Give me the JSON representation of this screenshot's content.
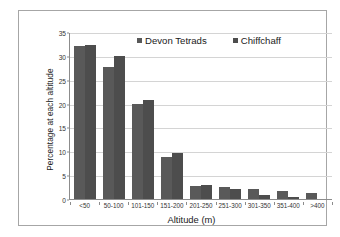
{
  "chart_data": {
    "type": "bar",
    "title": "",
    "xlabel": "Altitude (m)",
    "ylabel": "Percentage at each altitude",
    "categories": [
      "<50",
      "50-100",
      "101-150",
      "151-200",
      "201-250",
      "251-300",
      "301-350",
      "351-400",
      ">400"
    ],
    "series": [
      {
        "name": "Devon Tetrads",
        "color": "#595959",
        "values": [
          32.0,
          27.7,
          19.9,
          8.9,
          2.7,
          2.6,
          2.0,
          1.6,
          1.3
        ]
      },
      {
        "name": "Chiffchaff",
        "color": "#4d4d4d",
        "values": [
          32.3,
          29.9,
          20.8,
          9.7,
          2.9,
          2.1,
          0.9,
          0.4,
          0.0
        ]
      }
    ],
    "ylim": [
      0,
      35
    ],
    "yticks": [
      0,
      5,
      10,
      15,
      20,
      25,
      30,
      35
    ],
    "ytick_labels": [
      "0",
      "5",
      "10",
      "15",
      "20",
      "25",
      "30",
      "35"
    ],
    "grid": true,
    "legend_position": "top-center"
  },
  "legend": {
    "items": [
      {
        "label": "Devon Tetrads",
        "marker": "square-marker",
        "color": "#595959"
      },
      {
        "label": "Chiffchaff",
        "marker": "square-marker",
        "color": "#4d4d4d"
      }
    ]
  },
  "axes": {
    "x_title": "Altitude (m)",
    "y_title": "Percentage at each altitude"
  },
  "style": {
    "frame_color": "#a6a6a6",
    "gridline_color": "#d4d4d4",
    "axis_color": "#8c8c8c",
    "background": "#ffffff",
    "text_color": "#1a1a1a"
  }
}
